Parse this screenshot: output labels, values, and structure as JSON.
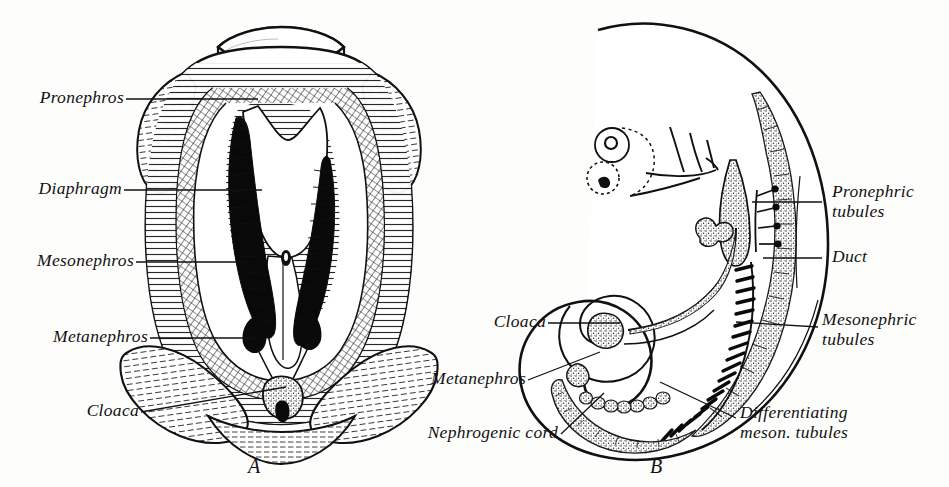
{
  "figure": {
    "background_color": "#fdfdfb",
    "ink_color": "#111111",
    "panels": [
      {
        "id": "A",
        "letter": "A",
        "caption": "Ventral view of dissected urogenital region showing pronephros, diaphragm, mesonephros, metanephros and cloaca"
      },
      {
        "id": "B",
        "letter": "B",
        "caption": "Lateral view of curled embryo showing nephrogenic cord, pronephric tubules, duct, mesonephric tubules and cloaca"
      }
    ]
  },
  "panel_a": {
    "letter": "A",
    "labels": [
      {
        "key": "pronephros",
        "text": "Pronephros",
        "name": "label-pronephros"
      },
      {
        "key": "diaphragm",
        "text": "Diaphragm",
        "name": "label-diaphragm"
      },
      {
        "key": "mesonephros",
        "text": "Mesonephros",
        "name": "label-mesonephros"
      },
      {
        "key": "metanephros",
        "text": "Metanephros",
        "name": "label-metanephros"
      },
      {
        "key": "cloaca",
        "text": "Cloaca",
        "name": "label-cloaca"
      }
    ],
    "label_pronephros": "Pronephros",
    "label_diaphragm": "Diaphragm",
    "label_mesonephros": "Mesonephros",
    "label_metanephros": "Metanephros",
    "label_cloaca": "Cloaca"
  },
  "panel_b": {
    "letter": "B",
    "label_cloaca": "Cloaca",
    "label_metanephros": "Metanephros",
    "label_nephrogenic_cord": "Nephrogenic cord",
    "label_pronephric_tubules_line1": "Pronephric",
    "label_pronephric_tubules_line2": "tubules",
    "label_duct": "Duct",
    "label_mesonephric_tubules_line1": "Mesonephric",
    "label_mesonephric_tubules_line2": "tubules",
    "label_differentiating_line1": "Differentiating",
    "label_differentiating_line2": "meson. tubules"
  }
}
